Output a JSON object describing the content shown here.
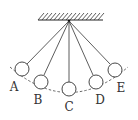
{
  "diagram": {
    "type": "pendulum-positions",
    "ceiling": {
      "x1": 38,
      "x2": 103,
      "y": 20,
      "hatch_color": "#222222"
    },
    "pivot": {
      "x": 69,
      "y": 21
    },
    "bob_radius": 7,
    "positions": [
      {
        "label": "A",
        "bob": {
          "x": 22,
          "y": 69
        },
        "label_pos": {
          "x": 14,
          "y": 91
        }
      },
      {
        "label": "B",
        "bob": {
          "x": 41,
          "y": 82
        },
        "label_pos": {
          "x": 38,
          "y": 104
        }
      },
      {
        "label": "C",
        "bob": {
          "x": 69,
          "y": 89
        },
        "label_pos": {
          "x": 69,
          "y": 111
        }
      },
      {
        "label": "D",
        "bob": {
          "x": 96,
          "y": 82
        },
        "label_pos": {
          "x": 100,
          "y": 104
        }
      },
      {
        "label": "E",
        "bob": {
          "x": 115,
          "y": 70
        },
        "label_pos": {
          "x": 121,
          "y": 92
        }
      }
    ],
    "arc": {
      "style": "dashed",
      "color": "#555555"
    }
  }
}
